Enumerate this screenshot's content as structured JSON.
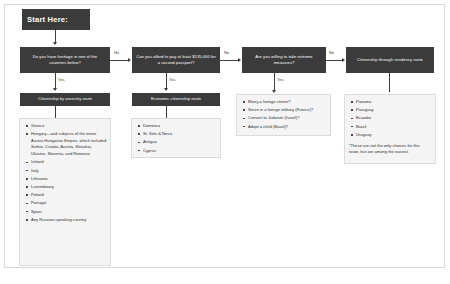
{
  "diagram": {
    "colors": {
      "node_fill": "#3b3b3b",
      "node_text": "#ffffff",
      "list_fill": "#f4f4f4",
      "list_border": "#dcdcdc",
      "connector": "#3f3f3f",
      "canvas": "#ffffff"
    },
    "start": {
      "label": "Start Here:"
    },
    "edges": {
      "no_1": "No",
      "no_2": "No",
      "no_3": "No",
      "yes_1": "Yes",
      "yes_2": "Yes",
      "yes_3": "Yes"
    },
    "columns": [
      {
        "question": "Do you have heritage in one of the countries below?",
        "route": "Citizenship by ancestry route",
        "items": [
          "Greece",
          "Hungary—and subjects of the entire Austro-Hungarian Empire, which included Serbia, Croatia, Austria, Slovakia, Ukraine, Slovenia, and Romania",
          "Ireland",
          "Italy",
          "Lithuania",
          "Luxembourg",
          "Poland",
          "Portugal",
          "Spain",
          "Any Russian-speaking country"
        ],
        "note": ""
      },
      {
        "question": "Can you afford to pay at least $135,000 for a second passport?",
        "route": "Economic citizenship route",
        "items": [
          "Dominica",
          "St. Kitts & Nevis",
          "Antigua",
          "Cyprus"
        ],
        "note": ""
      },
      {
        "question": "Are you willing to take extreme measures?",
        "route": "",
        "items": [
          "Marry a foreign citizen?",
          "Serve in a foreign military (France)?",
          "Convert to Judaism (Israel)?",
          "Adopt a child (Brazil)?"
        ],
        "note": ""
      },
      {
        "question": "Citizenship through residency route",
        "route": "",
        "items": [
          "Panama",
          "Paraguay",
          "Ecuador",
          "Brazil",
          "Uruguay"
        ],
        "note": "*These are not the only choices for this route, but are among the easiest."
      }
    ]
  }
}
